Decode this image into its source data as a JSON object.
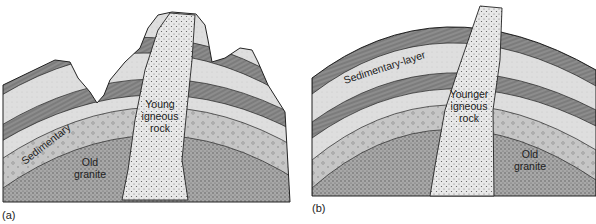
{
  "panels": [
    {
      "id": "a",
      "caption": "(a)",
      "labels": {
        "sedimentary": "Sedimentary",
        "granite_1": "Old",
        "granite_2": "granite",
        "igneous_1": "Young",
        "igneous_2": "igneous",
        "igneous_3": "rock"
      }
    },
    {
      "id": "b",
      "caption": "(b)",
      "labels": {
        "sedimentary": "Sedimentary-layer",
        "igneous_1": "Younger",
        "igneous_2": "igneous",
        "igneous_3": "rock",
        "granite_1": "Old",
        "granite_2": "granite"
      }
    }
  ],
  "colors": {
    "outline": "#222222",
    "granite": "#9a9a9a",
    "conglomerate": "#c4c4c4",
    "light_layer": "#dcdcdc",
    "striped_layer": "#8a8a8a",
    "intrusion": "#e6e6e6"
  }
}
